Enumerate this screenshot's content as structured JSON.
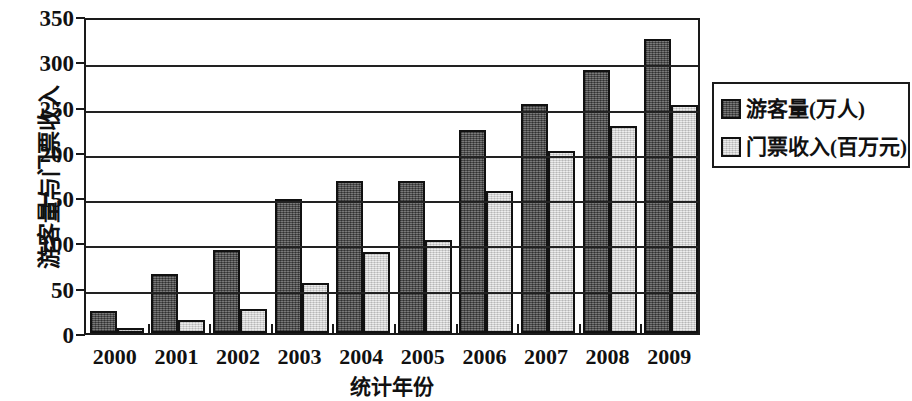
{
  "chart_data": {
    "type": "bar",
    "title": "",
    "xlabel": "统计年份",
    "ylabel": "游客量与门票收入",
    "categories": [
      "2000",
      "2001",
      "2002",
      "2003",
      "2004",
      "2005",
      "2006",
      "2007",
      "2008",
      "2009"
    ],
    "series": [
      {
        "name": "游客量(万人)",
        "color": "#595959",
        "values": [
          24,
          65,
          92,
          148,
          168,
          168,
          224,
          253,
          290,
          325
        ]
      },
      {
        "name": "门票收入(百万元)",
        "color": "#dcdcdc",
        "values": [
          5,
          14,
          26,
          55,
          90,
          103,
          157,
          201,
          229,
          252
        ]
      }
    ],
    "ylim": [
      0,
      350
    ],
    "yticks": [
      0,
      50,
      100,
      150,
      200,
      250,
      300,
      350
    ],
    "ytick_labels": [
      "0",
      "50",
      "100",
      "150",
      "200",
      "250",
      "300",
      "350"
    ],
    "grid": "horizontal",
    "legend_position": "right"
  },
  "axis": {
    "y_title": "游客量与门票收入",
    "x_title": "统计年份"
  },
  "legend": {
    "entries": [
      {
        "label": "游客量(万人)",
        "swatch": "dark-swatch"
      },
      {
        "label": "门票收入(百万元)",
        "swatch": "light-swatch"
      }
    ]
  }
}
